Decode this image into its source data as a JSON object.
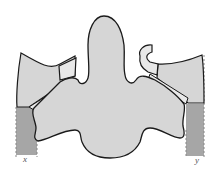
{
  "diagram": {
    "labels": {
      "left": "x",
      "right": "y"
    },
    "colors": {
      "body_fill": "#d6d6d6",
      "outline": "#1a1a1a",
      "column_fill": "#a6a6a6",
      "bridge_fill": "#e8e8e8",
      "label": "#555555"
    }
  }
}
